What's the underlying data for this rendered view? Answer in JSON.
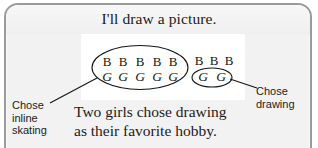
{
  "card": {
    "border_color": "#9a9a9a",
    "background_color": "#f2f2f2"
  },
  "title": "I'll draw a picture.",
  "diagram": {
    "panel_background": "#ffffff",
    "ink_color": "#141414",
    "groups": [
      {
        "name": "inline-skating-group",
        "b_count": 5,
        "g_count": 5,
        "b_letters": [
          "B",
          "B",
          "B",
          "B",
          "B"
        ],
        "g_letters": [
          "G",
          "G",
          "G",
          "G",
          "G"
        ],
        "circled": "all",
        "label": "Chose\ninline\nskating"
      },
      {
        "name": "drawing-group",
        "b_count": 3,
        "g_count": 2,
        "b_letters": [
          "B",
          "B",
          "B"
        ],
        "g_letters": [
          "G",
          "G"
        ],
        "circled": "girls-only",
        "label": "Chose\ndrawing"
      }
    ]
  },
  "labels": {
    "left": "Chose\ninline\nskating",
    "right": "Chose\ndrawing"
  },
  "caption": "Two girls chose drawing\nas their favorite hobby."
}
